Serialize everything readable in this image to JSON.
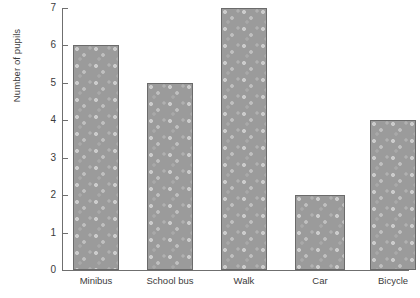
{
  "chart_data": {
    "type": "bar",
    "title": "",
    "xlabel": "",
    "ylabel": "Number of pupils",
    "categories": [
      "Minibus",
      "School bus",
      "Walk",
      "Car",
      "Bicycle"
    ],
    "values": [
      6,
      5,
      7,
      2,
      4
    ],
    "ylim": [
      0,
      7
    ],
    "ytick_labels": [
      "0",
      "1",
      "2",
      "3",
      "4",
      "5",
      "6",
      "7"
    ],
    "ytick_values": [
      0,
      1,
      2,
      3,
      4,
      5,
      6,
      7
    ],
    "grid": false,
    "legend": null,
    "bar_fill_color": "#9b9b9b",
    "bar_border_color": "#6b6b6b",
    "axis_color": "#6f6f6f",
    "text_color": "#3b3b3b",
    "background_color": "#ffffff",
    "note": "Rightmost bar (Bicycle) is clipped by the right edge of the image"
  }
}
